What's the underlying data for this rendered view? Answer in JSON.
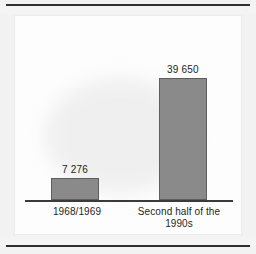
{
  "chart_data": {
    "type": "bar",
    "title": "",
    "subtitle": "",
    "xlabel": "",
    "ylabel": "",
    "categories": [
      "1968/1969",
      "Second half of the 1990s"
    ],
    "category_lines": [
      [
        "1968/1969"
      ],
      [
        "Second half of the",
        "1990s"
      ]
    ],
    "values": [
      7276,
      39650
    ],
    "value_labels": [
      "7 276",
      "39 650"
    ],
    "ylim": [
      0,
      39650
    ],
    "grid": false,
    "legend": false,
    "legend_position": "none",
    "axis": {
      "baseline_visible": true,
      "y_ticks_visible": false,
      "x_ticks_visible": false
    },
    "style": {
      "bar_fill": "#8a8a8a",
      "bar_edge": "#5e5e5e",
      "baseline_color": "#3a3a3a",
      "panel_background": "#fdfdfd",
      "page_background": "#f2f2f2",
      "rule_color": "#2f2f2f",
      "text_color": "#1f1f1f"
    }
  }
}
